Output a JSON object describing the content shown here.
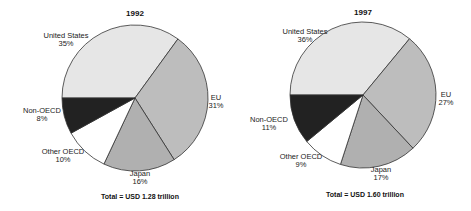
{
  "chart_data": [
    {
      "type": "pie",
      "title": "1992",
      "categories": [
        "United States",
        "EU",
        "Japan",
        "Other OECD",
        "Non-OECD"
      ],
      "values": [
        35,
        31,
        16,
        10,
        8
      ],
      "labels": [
        "35%",
        "31%",
        "16%",
        "10%",
        "8%"
      ],
      "colors": [
        "#e6e6e6",
        "#bdbdbd",
        "#b0b0b0",
        "#ffffff",
        "#222222"
      ],
      "start_angle_deg": 180,
      "direction": "clockwise",
      "footer": "Total = USD 1.28 trillion"
    },
    {
      "type": "pie",
      "title": "1997",
      "categories": [
        "United States",
        "EU",
        "Japan",
        "Other OECD",
        "Non-OECD"
      ],
      "values": [
        36,
        27,
        17,
        9,
        11
      ],
      "labels": [
        "36%",
        "27%",
        "17%",
        "9%",
        "11%"
      ],
      "colors": [
        "#e6e6e6",
        "#bdbdbd",
        "#b0b0b0",
        "#ffffff",
        "#222222"
      ],
      "start_angle_deg": 180,
      "direction": "clockwise",
      "footer": "Total = USD 1.60 trillion"
    }
  ],
  "charts": [
    {
      "title": "1992",
      "footer": "Total = USD 1.28 trillion",
      "slices": [
        {
          "name": "United States",
          "pct": "35%"
        },
        {
          "name": "EU",
          "pct": "31%"
        },
        {
          "name": "Japan",
          "pct": "16%"
        },
        {
          "name": "Other OECD",
          "pct": "10%"
        },
        {
          "name": "Non-OECD",
          "pct": "8%"
        }
      ]
    },
    {
      "title": "1997",
      "footer": "Total = USD 1.60 trillion",
      "slices": [
        {
          "name": "United States",
          "pct": "36%"
        },
        {
          "name": "EU",
          "pct": "27%"
        },
        {
          "name": "Japan",
          "pct": "17%"
        },
        {
          "name": "Other OECD",
          "pct": "9%"
        },
        {
          "name": "Non-OECD",
          "pct": "11%"
        }
      ]
    }
  ]
}
